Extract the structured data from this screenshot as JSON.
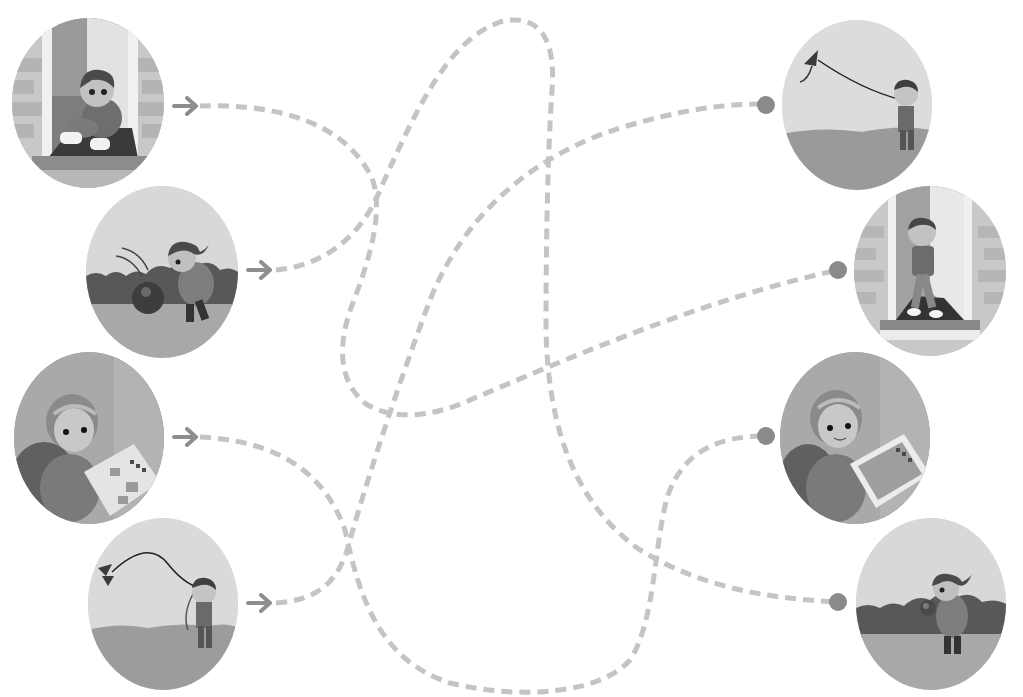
{
  "puzzle": {
    "type": "matching-maze",
    "instruction_visible": false,
    "line_color": "#c4c4c4",
    "arrow_color": "#8e8e8e",
    "dot_color": "#8a8a8a"
  },
  "left_pictures": [
    {
      "id": "L1",
      "scene": "boy tying shoelaces sitting in doorway",
      "name": "picture-boy-tying-shoes"
    },
    {
      "id": "L2",
      "scene": "girl chasing ball near bushes",
      "name": "picture-girl-chasing-ball"
    },
    {
      "id": "L3",
      "scene": "girl frowning at unfinished jigsaw puzzle",
      "name": "picture-girl-puzzle-unfinished"
    },
    {
      "id": "L4",
      "scene": "boy with falling kite",
      "name": "picture-boy-kite-falling"
    }
  ],
  "right_pictures": [
    {
      "id": "R1",
      "scene": "boy flying kite high",
      "name": "picture-boy-kite-flying"
    },
    {
      "id": "R2",
      "scene": "boy walking out of door",
      "name": "picture-boy-leaving-house"
    },
    {
      "id": "R3",
      "scene": "girl smiling with finished puzzle",
      "name": "picture-girl-puzzle-finished"
    },
    {
      "id": "R4",
      "scene": "girl holding caught ball",
      "name": "picture-girl-holding-ball"
    }
  ],
  "paths": [
    {
      "from": "L1",
      "to": "R2"
    },
    {
      "from": "L2",
      "to": "R4"
    },
    {
      "from": "L3",
      "to": "R3"
    },
    {
      "from": "L4",
      "to": "R1"
    }
  ]
}
